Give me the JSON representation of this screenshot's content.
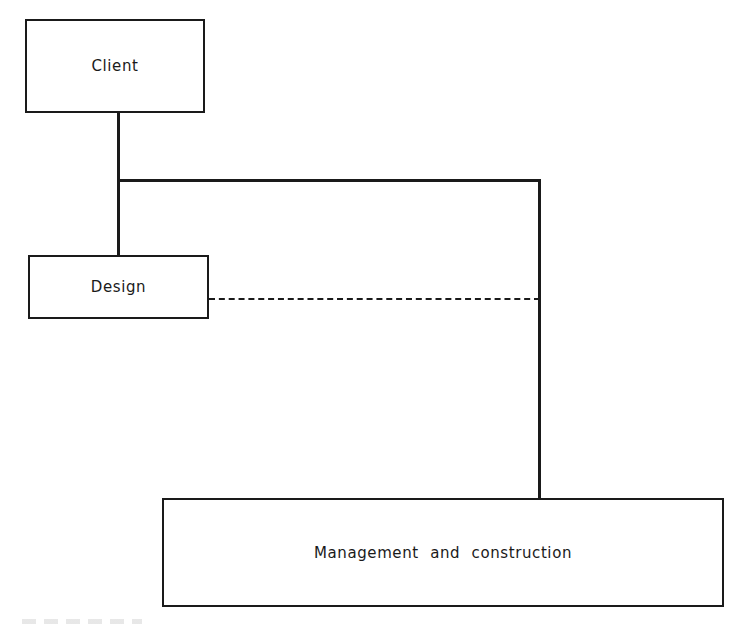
{
  "diagram": {
    "nodes": [
      {
        "id": "client",
        "label": "Client"
      },
      {
        "id": "design",
        "label": "Design"
      },
      {
        "id": "management",
        "label": "Management and construction"
      }
    ],
    "edges": [
      {
        "from": "client",
        "to": "design",
        "style": "solid"
      },
      {
        "from": "client",
        "to": "management",
        "style": "solid"
      },
      {
        "from": "design",
        "to": "management",
        "style": "dashed"
      }
    ]
  }
}
